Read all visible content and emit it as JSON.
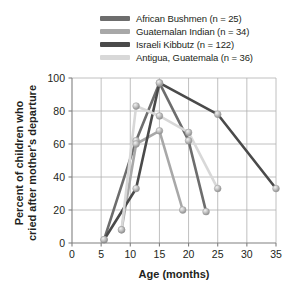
{
  "chart_data": {
    "type": "line",
    "title": "",
    "xlabel": "Age (months)",
    "ylabel": "Percent of children who cried after mother's departure",
    "xlim": [
      0,
      35
    ],
    "ylim": [
      0,
      100
    ],
    "xticks": [
      0,
      5,
      10,
      15,
      20,
      25,
      30,
      35
    ],
    "yticks": [
      0,
      20,
      40,
      60,
      80,
      100
    ],
    "grid": true,
    "legend_position": "top-right",
    "marker": "circle-sphere-grey",
    "series": [
      {
        "name": "African Bushmen (n = 25)",
        "color": "#6d6d6d",
        "x": [
          5.5,
          11,
          15,
          20,
          23
        ],
        "y": [
          2,
          62,
          97,
          62,
          19
        ]
      },
      {
        "name": "Guatemalan Indian (n = 34)",
        "color": "#a8a8a8",
        "x": [
          8.5,
          11,
          15,
          19
        ],
        "y": [
          8,
          60,
          68,
          20
        ]
      },
      {
        "name": "Israeli Kibbutz (n = 122)",
        "color": "#4a4a4a",
        "x": [
          5.5,
          11,
          15,
          25,
          35
        ],
        "y": [
          2,
          33,
          97,
          78,
          33
        ]
      },
      {
        "name": "Antigua, Guatemala (n = 36)",
        "color": "#d8d8d8",
        "x": [
          8.5,
          11,
          15,
          20,
          25
        ],
        "y": [
          8,
          83,
          77,
          67,
          33
        ]
      }
    ]
  },
  "legend": {
    "items": [
      {
        "label": "African Bushmen (n = 25)",
        "color": "#6d6d6d"
      },
      {
        "label": "Guatemalan Indian (n = 34)",
        "color": "#a8a8a8"
      },
      {
        "label": "Israeli Kibbutz (n = 122)",
        "color": "#4a4a4a"
      },
      {
        "label": "Antigua, Guatemala (n = 36)",
        "color": "#d8d8d8"
      }
    ]
  },
  "axes": {
    "x_title": "Age (months)",
    "y_title_line1": "Percent of children who",
    "y_title_line2": "cried after mother's departure",
    "x_tick_labels": [
      "0",
      "5",
      "10",
      "15",
      "20",
      "25",
      "30",
      "35"
    ],
    "y_tick_labels": [
      "0",
      "20",
      "40",
      "60",
      "80",
      "100"
    ]
  },
  "style": {
    "axis_color": "#808080",
    "grid_color": "#b0b0b0",
    "text_color": "#231f20",
    "background": "#ffffff"
  }
}
